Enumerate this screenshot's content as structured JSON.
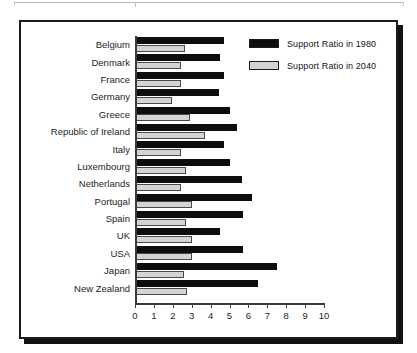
{
  "chart_data": {
    "type": "bar",
    "orientation": "horizontal",
    "title": "",
    "xlabel": "",
    "ylabel": "",
    "xlim": [
      0,
      10
    ],
    "xticks": [
      "0",
      "1",
      "2",
      "3",
      "4",
      "5",
      "6",
      "7",
      "8",
      "9",
      "10"
    ],
    "grid": false,
    "legend_position": "top-right",
    "categories": [
      "Belgium",
      "Denmark",
      "France",
      "Germany",
      "Greece",
      "Republic of Ireland",
      "Italy",
      "Luxembourg",
      "Netherlands",
      "Portugal",
      "Spain",
      "UK",
      "USA",
      "Japan",
      "New Zealand"
    ],
    "series": [
      {
        "name": "Support Ratio in 1980",
        "color": "#0d0d0d",
        "values": [
          4.7,
          4.5,
          4.7,
          4.45,
          5.0,
          5.4,
          4.7,
          5.0,
          5.65,
          6.2,
          5.7,
          4.5,
          5.7,
          7.5,
          6.5
        ]
      },
      {
        "name": "Support Ratio in 2040",
        "color": "#d4d4d4",
        "values": [
          2.65,
          2.45,
          2.45,
          1.95,
          2.9,
          3.7,
          2.45,
          2.7,
          2.45,
          3.0,
          2.7,
          3.0,
          3.0,
          2.6,
          2.75
        ]
      }
    ]
  },
  "legend": {
    "items": [
      {
        "label": "Support Ratio in 1980",
        "swatch": "black"
      },
      {
        "label": "Support Ratio in 2040",
        "swatch": "gray"
      }
    ]
  }
}
